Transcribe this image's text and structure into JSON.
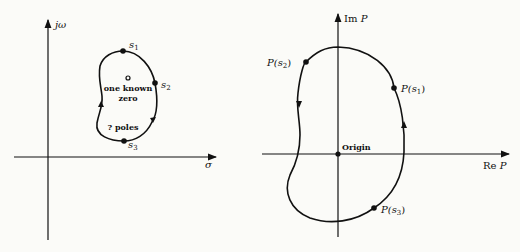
{
  "left_plot": {
    "title": "s-plane",
    "y_axis_label": "jω",
    "x_axis_label": "σ",
    "points": [
      {
        "name": "s",
        "sub": "1"
      },
      {
        "name": "s",
        "sub": "2"
      },
      {
        "name": "s",
        "sub": "3"
      }
    ],
    "zero_label_line1": "one known",
    "zero_label_line2": "zero",
    "poles_label": "? poles"
  },
  "right_plot": {
    "title": "P-plane",
    "y_axis_label_prefix": "Im",
    "y_axis_label_var": "P",
    "x_axis_label_prefix": "Re",
    "x_axis_label_var": "P",
    "origin_label": "Origin",
    "points": [
      {
        "func": "P(",
        "name": "s",
        "sub": "1",
        "close": ")"
      },
      {
        "func": "P(",
        "name": "s",
        "sub": "2",
        "close": ")"
      },
      {
        "func": "P(",
        "name": "s",
        "sub": "3",
        "close": ")"
      }
    ]
  },
  "colors": {
    "ink": "#111111",
    "paper": "#fbfbf8"
  }
}
